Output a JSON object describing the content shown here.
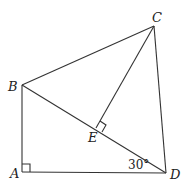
{
  "diagram": {
    "type": "geometry",
    "points": {
      "A": {
        "label": "A",
        "x": 22,
        "y": 172
      },
      "B": {
        "label": "B",
        "x": 22,
        "y": 85
      },
      "C": {
        "label": "C",
        "x": 154,
        "y": 26
      },
      "D": {
        "label": "D",
        "x": 166,
        "y": 173
      },
      "E": {
        "label": "E",
        "x": 96,
        "y": 127
      }
    },
    "segments": [
      "AB",
      "AD",
      "BC",
      "BD",
      "CD",
      "CE"
    ],
    "right_angles": [
      "A",
      "E"
    ],
    "angle_label": "30°"
  }
}
